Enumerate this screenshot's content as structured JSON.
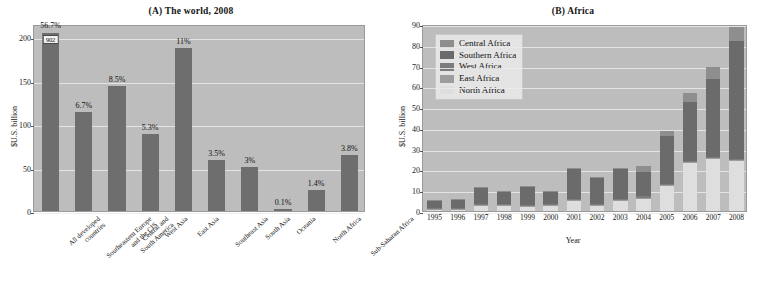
{
  "figure": {
    "width": 764,
    "height": 298,
    "panels": [
      "A",
      "B"
    ]
  },
  "panelA": {
    "title_tag": "(A)",
    "title_text": "The world, 2008",
    "full_title": "(A) The world, 2008",
    "ylabel": "$U.S. billion",
    "break_value": "902"
  },
  "panelB": {
    "title_tag": "(B)",
    "title_text": "Africa",
    "full_title": "(B) Africa",
    "ylabel": "$U.S. billion",
    "xlabel": "Year",
    "legend_title": ""
  },
  "colors": {
    "plot_background": "#bdbdbd",
    "bar_gray": "#6e6e6e",
    "gridline": "#eceaea",
    "central_africa": "#8e8e8e",
    "southern_africa": "#6b6b6b",
    "west_africa": "#7c7c7c",
    "east_africa": "#9d9d9d",
    "north_africa": "#dedede",
    "legend_background": "#e4e4e4"
  },
  "chart_data": [
    {
      "type": "bar",
      "panel": "A",
      "title": "(A) The world, 2008",
      "xlabel": "",
      "ylabel": "$U.S. billion",
      "ylim": [
        0,
        215
      ],
      "yticks": [
        0,
        50,
        100,
        150,
        200
      ],
      "grid": true,
      "axis_break": true,
      "axis_break_note": "First bar truncated; actual value 902",
      "categories": [
        "All developed countries",
        "Southeastern Europe and the CIS",
        "Central and South America",
        "West Asia",
        "East Asia",
        "Southeast Asia",
        "South Asia",
        "Oceania",
        "North Africa",
        "Sub-Saharan Africa"
      ],
      "category_lines": [
        [
          "All developed",
          "countries"
        ],
        [
          "Southeastern Europe",
          "and the CIS"
        ],
        [
          "Central and",
          "South America"
        ],
        [
          "West Asia"
        ],
        [
          "East Asia"
        ],
        [
          "Southeast Asia"
        ],
        [
          "South Asia"
        ],
        [
          "Oceania"
        ],
        [
          "North Africa"
        ],
        [
          "Sub-Saharan Africa"
        ]
      ],
      "values": [
        902,
        114,
        144,
        89,
        187,
        59,
        51,
        2,
        24,
        64
      ],
      "plotted_values": [
        205,
        114,
        144,
        89,
        187,
        59,
        51,
        2,
        24,
        64
      ],
      "data_labels": [
        "56.7%",
        "6.7%",
        "8.5%",
        "5.3%",
        "11%",
        "3.5%",
        "3%",
        "0.1%",
        "1.4%",
        "3.8%"
      ]
    },
    {
      "type": "bar",
      "subtype": "stacked",
      "panel": "B",
      "title": "(B) Africa",
      "xlabel": "Year",
      "ylabel": "$U.S. billion",
      "ylim": [
        0,
        90
      ],
      "yticks": [
        0,
        10,
        20,
        30,
        40,
        50,
        60,
        70,
        80,
        90
      ],
      "grid": true,
      "legend_position": "upper-left",
      "categories": [
        "1995",
        "1996",
        "1997",
        "1998",
        "1999",
        "2000",
        "2001",
        "2002",
        "2003",
        "2004",
        "2005",
        "2006",
        "2007",
        "2008"
      ],
      "series": [
        {
          "name": "North Africa",
          "values": [
            0.6,
            0.5,
            2.5,
            2.5,
            2.0,
            2.5,
            5.0,
            2.5,
            5.0,
            6.0,
            12.0,
            23.0,
            25.0,
            24.0
          ]
        },
        {
          "name": "East Africa",
          "values": [
            0.4,
            0.4,
            0.5,
            0.5,
            0.5,
            0.5,
            0.5,
            0.5,
            0.5,
            0.5,
            0.5,
            0.5,
            0.5,
            0.5
          ]
        },
        {
          "name": "West Africa",
          "values": [
            0.5,
            0.5,
            0.5,
            0.5,
            0.5,
            0.5,
            0.5,
            0.5,
            0.5,
            0.5,
            0.5,
            0.5,
            0.5,
            0.5
          ]
        },
        {
          "name": "Southern Africa",
          "values": [
            3.5,
            4.0,
            7.5,
            5.5,
            8.5,
            5.5,
            14.0,
            12.5,
            14.0,
            12.0,
            23.0,
            28.5,
            37.5,
            57.0
          ]
        },
        {
          "name": "Central Africa",
          "values": [
            0.5,
            0.5,
            0.5,
            0.5,
            0.5,
            0.5,
            0.5,
            0.5,
            0.5,
            2.5,
            2.5,
            4.5,
            6.0,
            6.5
          ]
        }
      ],
      "totals": [
        5.5,
        5.9,
        11.5,
        9.5,
        12.0,
        9.5,
        20.5,
        16.5,
        20.5,
        21.5,
        38.5,
        57.0,
        69.5,
        88.5
      ],
      "legend_entries": [
        "Central Africa",
        "Southern Africa",
        "West Africa",
        "East Africa",
        "North Africa"
      ]
    }
  ]
}
